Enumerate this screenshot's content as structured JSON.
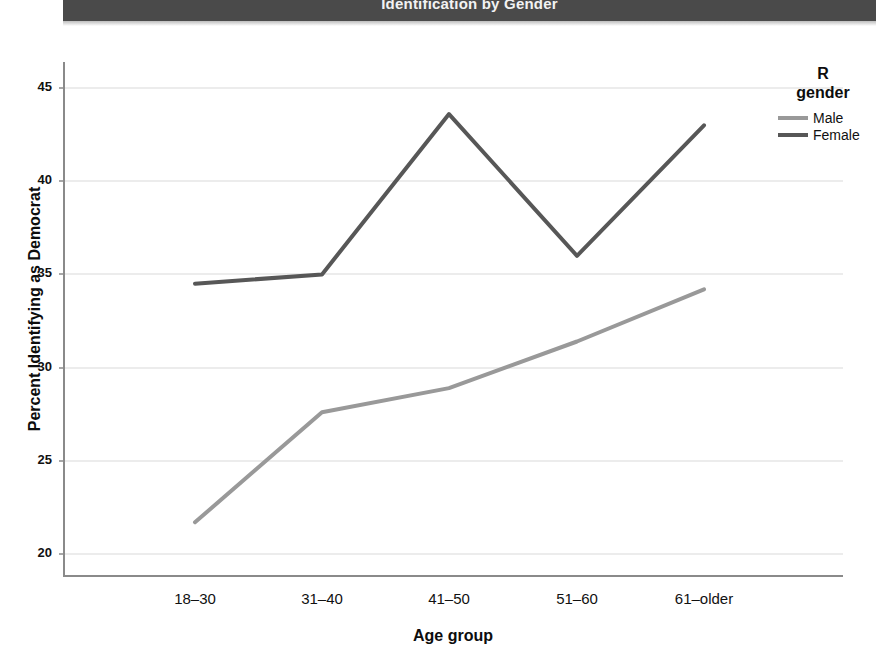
{
  "header": {
    "title": "Identification by Gender"
  },
  "chart_data": {
    "type": "line",
    "title": "Identification by Gender",
    "xlabel": "Age group",
    "ylabel": "Percent Identifying as Democrat",
    "categories": [
      "18–30",
      "31–40",
      "41–50",
      "51–60",
      "61–older"
    ],
    "series": [
      {
        "name": "Male",
        "values": [
          21.7,
          27.6,
          28.9,
          31.4,
          34.2
        ],
        "color": "#999999"
      },
      {
        "name": "Female",
        "values": [
          34.5,
          35.0,
          43.6,
          36.0,
          43.0
        ],
        "color": "#575757"
      }
    ],
    "ylim": [
      18.5,
      46.2
    ],
    "yticks": [
      20,
      25,
      30,
      35,
      40,
      45
    ],
    "ytick_labels": [
      "20",
      "25",
      "30",
      "35",
      "40",
      "45"
    ],
    "grid": true,
    "grid_axis": "y",
    "legend": {
      "title_line1": "R",
      "title_line2": "gender",
      "position": "right",
      "entries": [
        "Male",
        "Female"
      ]
    }
  },
  "colors": {
    "male": "#999999",
    "female": "#575757",
    "axis": "#8a8a8a",
    "grid": "#d9d9d9",
    "title_bar": "#4a4a4a",
    "title_text": "#f2f2f2"
  }
}
